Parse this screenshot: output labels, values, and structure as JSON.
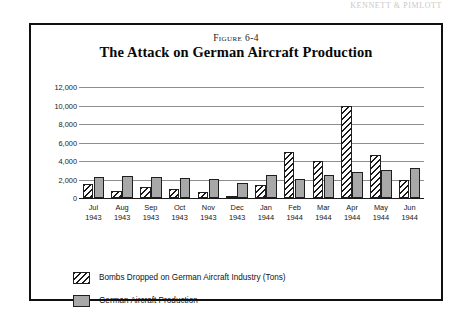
{
  "page": {
    "running_head": "KENNETT & PIMLOTT"
  },
  "figure": {
    "label": "Figure 6-4",
    "title": "The Attack on German Aircraft Production"
  },
  "legend": {
    "items": [
      {
        "swatch": "diagonal-hatch-swatch",
        "label": "Bombs Dropped on German Aircraft Industry (Tons)"
      },
      {
        "swatch": "solid-gray-swatch",
        "label": "German Aircraft Production"
      }
    ]
  },
  "chart_data": {
    "type": "bar",
    "title": "The Attack on German Aircraft Production",
    "xlabel": "",
    "ylabel": "",
    "ylim": [
      0,
      12000
    ],
    "ytick_values": [
      0,
      2000,
      4000,
      6000,
      8000,
      10000,
      12000
    ],
    "ytick_labels": [
      "0",
      "2,000",
      "4,000",
      "6,000",
      "8,000",
      "10,000",
      "12,000"
    ],
    "grid": true,
    "legend_position": "below",
    "categories": [
      "Jul 1943",
      "Aug 1943",
      "Sep 1943",
      "Oct 1943",
      "Nov 1943",
      "Dec 1943",
      "Jan 1944",
      "Feb 1944",
      "Mar 1944",
      "Apr 1944",
      "May 1944",
      "Jun 1944"
    ],
    "category_months": [
      "Jul",
      "Aug",
      "Sep",
      "Oct",
      "Nov",
      "Dec",
      "Jan",
      "Feb",
      "Mar",
      "Apr",
      "May",
      "Jun"
    ],
    "category_years": [
      "1943",
      "1943",
      "1943",
      "1943",
      "1943",
      "1943",
      "1944",
      "1944",
      "1944",
      "1944",
      "1944",
      "1944"
    ],
    "series": [
      {
        "name": "Bombs Dropped on German Aircraft Industry (Tons)",
        "pattern": "diagonal-hatch",
        "values": [
          1500,
          800,
          1200,
          1000,
          700,
          200,
          1400,
          5000,
          4000,
          10000,
          4700,
          2000
        ]
      },
      {
        "name": "German Aircraft Production",
        "pattern": "solid-gray",
        "values": [
          2300,
          2400,
          2300,
          2200,
          2100,
          1600,
          2500,
          2100,
          2500,
          2800,
          3000,
          3200
        ]
      }
    ]
  }
}
